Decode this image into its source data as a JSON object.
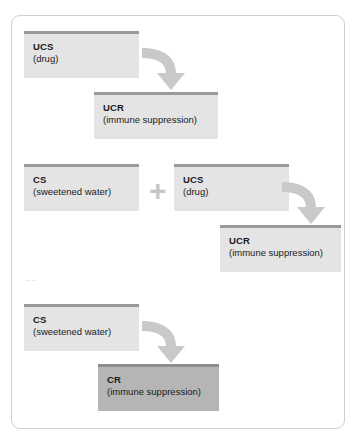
{
  "diagram": {
    "colors": {
      "box_fill_light": "#e4e4e4",
      "box_fill_dark": "#b5b5b5",
      "box_top_bar": "#9a9a9a",
      "arrow": "#c9c9c9",
      "plus": "#c6c6c6",
      "frame_border": "#cfcfcf",
      "text": "#1a1a1a"
    },
    "stages": [
      {
        "name": "unconditioned-stage",
        "boxes": [
          {
            "abbr": "UCS",
            "detail": "(drug)"
          },
          {
            "abbr": "UCR",
            "detail": "(immune suppression)"
          }
        ],
        "arrow": "curved-arrow-down-right"
      },
      {
        "name": "pairing-stage",
        "operator": "+",
        "boxes": [
          {
            "abbr": "CS",
            "detail": "(sweetened water)"
          },
          {
            "abbr": "UCS",
            "detail": "(drug)"
          },
          {
            "abbr": "UCR",
            "detail": "(immune suppression)"
          }
        ],
        "arrow": "curved-arrow-down-right"
      },
      {
        "name": "conditioned-stage",
        "boxes": [
          {
            "abbr": "CS",
            "detail": "(sweetened water)"
          },
          {
            "abbr": "CR",
            "detail": "(immune suppression)"
          }
        ],
        "arrow": "curved-arrow-down-right"
      }
    ]
  }
}
